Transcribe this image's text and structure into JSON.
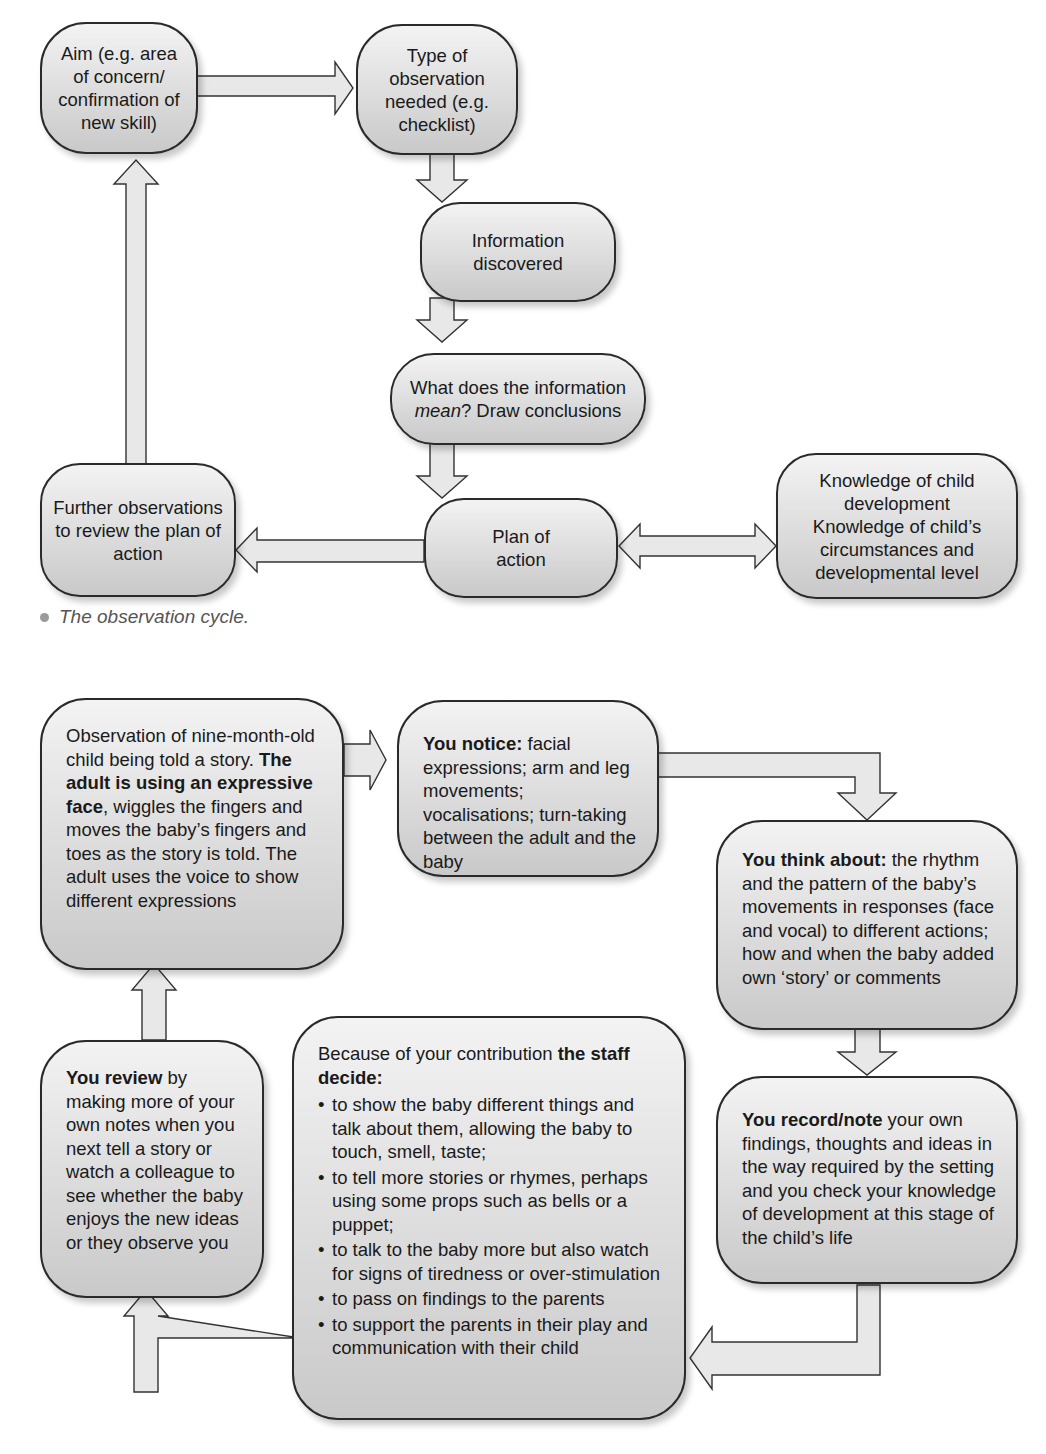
{
  "diagram1": {
    "caption": "The observation cycle.",
    "nodes": {
      "aim": "Aim (e.g. area of concern/ confirmation of new skill)",
      "type": "Type of observation needed (e.g. checklist)",
      "info": "Information discovered",
      "mean_pre": "What does the information ",
      "mean_em": "mean",
      "mean_post": "? Draw conclusions",
      "plan": "Plan of action",
      "further": "Further observations to review the plan of action",
      "knowledge": "Knowledge of child development Knowledge of child’s circumstances and developmental level"
    },
    "edges": [
      {
        "from": "aim",
        "to": "type"
      },
      {
        "from": "type",
        "to": "info"
      },
      {
        "from": "info",
        "to": "mean"
      },
      {
        "from": "mean",
        "to": "plan"
      },
      {
        "from": "plan",
        "to": "further"
      },
      {
        "from": "plan",
        "to": "knowledge",
        "bidirectional": true
      },
      {
        "from": "further",
        "to": "aim"
      }
    ]
  },
  "diagram2": {
    "observation": {
      "pre": "Observation of nine-month-old child being told a story. ",
      "bold": "The adult is using an expressive face",
      "post": ", wiggles the fingers and moves the baby’s fingers and toes as the story is told. The adult uses the voice to show different expressions"
    },
    "notice": {
      "bold": "You notice:",
      "text": " facial expressions; arm and leg movements; vocalisations; turn-taking between the adult and the baby"
    },
    "think": {
      "bold": "You think about:",
      "text": " the rhythm and the pattern of the baby’s movements in responses (face and vocal) to different actions; how and when the baby added own ‘story’ or comments"
    },
    "record": {
      "bold": "You record/note",
      "text": " your own findings, thoughts and ideas in the way required by the setting and you check your knowledge of development at this stage of the child’s life"
    },
    "staff": {
      "pre": "Because of your contribution ",
      "bold": "the staff decide:",
      "items": [
        "to show the baby different things and talk about them, allowing the baby to touch, smell, taste;",
        "to tell more stories or rhymes, perhaps using some props such as bells or a puppet;",
        "to talk to the baby more but also watch for signs of tiredness or over-stimulation",
        "to pass on findings to the parents",
        "to support the parents in their play and communication with their child"
      ]
    },
    "review": {
      "bold": "You review",
      "text": " by making more of your own notes when you next tell a story or watch a colleague to see whether the baby enjoys the new ideas or they observe you"
    }
  },
  "colors": {
    "box_fill_top": "#f3f3f3",
    "box_fill_bottom": "#c9c9c9",
    "outline": "#2a2a2a",
    "arrow_fill": "#e8e8e8",
    "caption": "#555555"
  }
}
